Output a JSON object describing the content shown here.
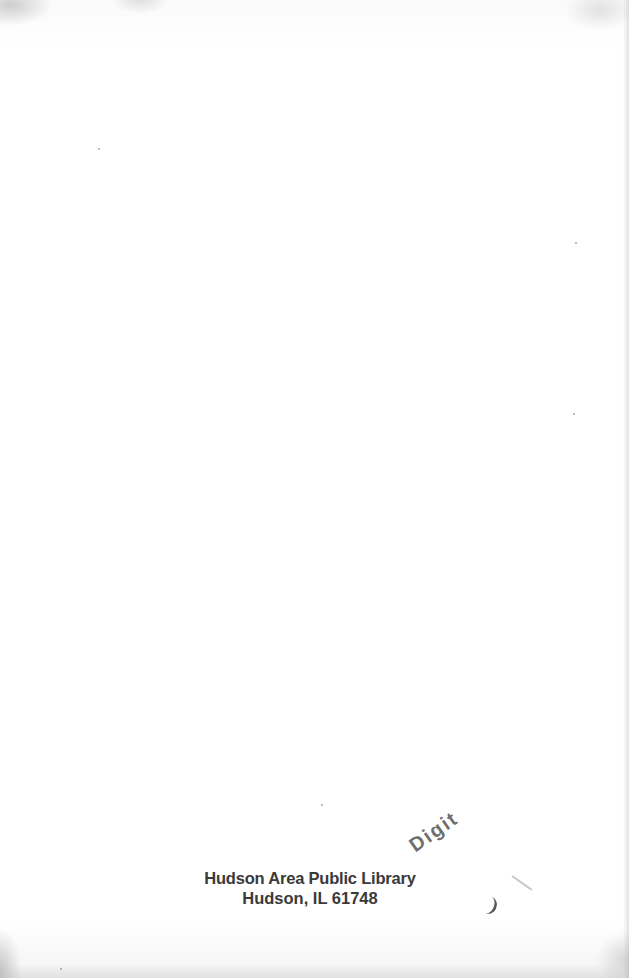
{
  "page": {
    "type": "scanned book endpaper (blank page)",
    "background_color": "#fdfdfd"
  },
  "stamp": {
    "overprint_fragment": "Digit",
    "line1": "Hudson Area Public Library",
    "line2": "Hudson, IL 61748",
    "ink_color": "#3a3a3a"
  }
}
